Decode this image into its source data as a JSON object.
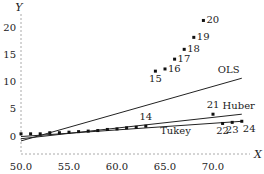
{
  "chart_data": {
    "type": "scatter",
    "title": "",
    "xlabel": "X",
    "ylabel": "Y",
    "xlim": [
      50.0,
      74.0
    ],
    "ylim": [
      -3,
      23
    ],
    "grid": false,
    "x_ticks": [
      "50.0",
      "55.0",
      "60.0",
      "65.0",
      "70.0"
    ],
    "y_ticks": [
      "0",
      "5",
      "10",
      "15",
      "20"
    ],
    "points": [
      {
        "id": 1,
        "x": 50.0,
        "y": 0.4,
        "label": ""
      },
      {
        "id": 2,
        "x": 51.0,
        "y": 0.4,
        "label": ""
      },
      {
        "id": 3,
        "x": 52.0,
        "y": 0.4,
        "label": ""
      },
      {
        "id": 4,
        "x": 53.0,
        "y": 0.6,
        "label": ""
      },
      {
        "id": 5,
        "x": 54.0,
        "y": 0.6,
        "label": ""
      },
      {
        "id": 6,
        "x": 55.0,
        "y": 0.7,
        "label": ""
      },
      {
        "id": 7,
        "x": 56.0,
        "y": 0.8,
        "label": ""
      },
      {
        "id": 8,
        "x": 57.0,
        "y": 0.9,
        "label": ""
      },
      {
        "id": 9,
        "x": 58.0,
        "y": 1.0,
        "label": ""
      },
      {
        "id": 10,
        "x": 59.0,
        "y": 1.2,
        "label": ""
      },
      {
        "id": 11,
        "x": 60.0,
        "y": 1.3,
        "label": ""
      },
      {
        "id": 12,
        "x": 61.0,
        "y": 1.5,
        "label": ""
      },
      {
        "id": 13,
        "x": 62.0,
        "y": 1.6,
        "label": ""
      },
      {
        "id": 14,
        "x": 63.0,
        "y": 1.8,
        "label": "14"
      },
      {
        "id": 15,
        "x": 64.0,
        "y": 11.9,
        "label": "15"
      },
      {
        "id": 16,
        "x": 65.0,
        "y": 12.3,
        "label": "16"
      },
      {
        "id": 17,
        "x": 66.0,
        "y": 14.1,
        "label": "17"
      },
      {
        "id": 18,
        "x": 67.0,
        "y": 15.9,
        "label": "18"
      },
      {
        "id": 19,
        "x": 68.0,
        "y": 18.1,
        "label": "19"
      },
      {
        "id": 20,
        "x": 69.0,
        "y": 21.2,
        "label": "20"
      },
      {
        "id": 21,
        "x": 70.0,
        "y": 4.0,
        "label": "21"
      },
      {
        "id": 22,
        "x": 71.0,
        "y": 2.3,
        "label": "22"
      },
      {
        "id": 23,
        "x": 72.0,
        "y": 2.5,
        "label": "23"
      },
      {
        "id": 24,
        "x": 73.0,
        "y": 2.7,
        "label": "24"
      }
    ],
    "series": [
      {
        "name": "OLS",
        "x": [
          50.0,
          73.0
        ],
        "y": [
          -0.9,
          10.6
        ]
      },
      {
        "name": "Huber",
        "x": [
          50.0,
          73.0
        ],
        "y": [
          -0.5,
          4.0
        ]
      },
      {
        "name": "Tukey",
        "x": [
          50.0,
          73.0
        ],
        "y": [
          -0.1,
          2.7
        ]
      }
    ],
    "line_labels": [
      {
        "text": "OLS",
        "x": 70.5,
        "y": 11.6
      },
      {
        "text": "Huber",
        "x": 71.0,
        "y": 5.0
      },
      {
        "text": "Tukey",
        "x": 64.5,
        "y": 0.3
      }
    ],
    "legend": null
  }
}
